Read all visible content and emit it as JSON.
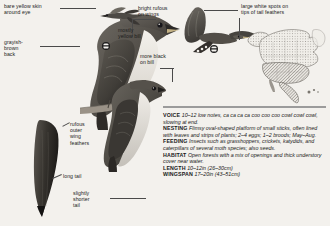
{
  "page": {
    "background_color": "#f3f1ed",
    "text_color": "#191919",
    "rule_color": "#9b9b9b"
  },
  "annotations": [
    {
      "id": "bare-yellow-skin",
      "text": "bare yellow skin\naround eye"
    },
    {
      "id": "grayish-brown-back",
      "text": "grayish-\nbrown\nback"
    },
    {
      "id": "bright-rufous-on-wings",
      "text": "bright rufous\non wings"
    },
    {
      "id": "mostly-yellow-bill",
      "text": "mostly\nyellow bill"
    },
    {
      "id": "large-white-spots",
      "text": "large white spots on\ntips of tail feathers"
    },
    {
      "id": "more-black-on-bill",
      "text": "more black\non bill"
    },
    {
      "id": "rufous-outer-wing-feathers",
      "text": "rufous\nouter\nwing\nfeathers"
    },
    {
      "id": "long-tail",
      "text": "long tail"
    },
    {
      "id": "slightly-shorter-tail",
      "text": "slightly\nshorter\ntail"
    }
  ],
  "info": {
    "entries": [
      {
        "key": "VOICE",
        "value": "10–12 low notes, ca ca ca ca coo coo coo cowl cowl cowl, slowing at end."
      },
      {
        "key": "NESTING",
        "value": "Flimsy oval-shaped platform of small sticks, often lined with leaves and strips of plants; 2–4 eggs; 1–2 broods; May–Aug."
      },
      {
        "key": "FEEDING",
        "value": "Insects such as grasshoppers, crickets, katydids, and caterpillars of several moth species; also seeds."
      },
      {
        "key": "HABITAT",
        "value": "Open forests with a mix of openings and thick understory cover near water."
      },
      {
        "key": "LENGTH",
        "value": "10–12in (26–30cm)"
      },
      {
        "key": "WINGSPAN",
        "value": "17–20in (43–51cm)"
      }
    ]
  },
  "range_map": {
    "region": "North America",
    "caption": ""
  },
  "illustrations": [
    {
      "id": "perched-adult",
      "subject": "perched-cuckoo-adult"
    },
    {
      "id": "perched-juvenile",
      "subject": "perched-cuckoo-second"
    },
    {
      "id": "flying-small",
      "subject": "cuckoo-in-flight-small"
    },
    {
      "id": "flying-large",
      "subject": "cuckoo-in-flight-underwing"
    },
    {
      "id": "tail-detail",
      "subject": "tail-underside-detail"
    }
  ]
}
